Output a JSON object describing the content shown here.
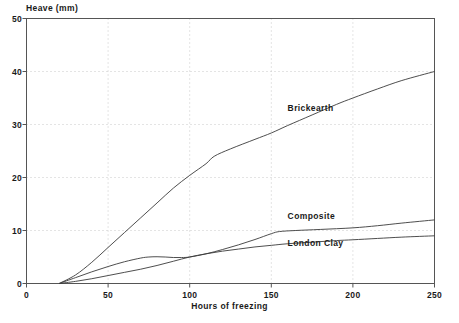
{
  "chart_data": {
    "type": "line",
    "title": "",
    "xlabel": "Hours of freezing",
    "ylabel": "Heave (mm)",
    "xlim": [
      0,
      250
    ],
    "ylim": [
      0,
      50
    ],
    "xticks": [
      0,
      50,
      100,
      150,
      200,
      250
    ],
    "yticks": [
      0,
      10,
      20,
      30,
      40,
      50
    ],
    "grid": true,
    "legend_position": "inline-annotations",
    "line_color": "#3a3a3a",
    "grid_color": "#c9c9c9",
    "axis_color": "#555555",
    "series": [
      {
        "name": "Brickearth",
        "label_x": 160,
        "label_y": 33,
        "x": [
          20,
          30,
          40,
          50,
          60,
          70,
          80,
          90,
          100,
          110,
          115,
          125,
          140,
          150,
          160,
          175,
          190,
          200,
          215,
          230,
          250
        ],
        "values": [
          0,
          1.6,
          4.0,
          6.8,
          9.6,
          12.4,
          15.2,
          18.0,
          20.4,
          22.6,
          24.0,
          25.4,
          27.2,
          28.4,
          29.8,
          31.8,
          33.8,
          35.0,
          36.7,
          38.3,
          40.0
        ]
      },
      {
        "name": "Composite",
        "label_x": 160,
        "label_y": 12.6,
        "x": [
          20,
          30,
          40,
          50,
          60,
          70,
          75,
          80,
          85,
          90,
          95,
          100,
          110,
          120,
          130,
          140,
          150,
          155,
          165,
          180,
          200,
          215,
          230,
          250
        ],
        "values": [
          0,
          1.1,
          2.2,
          3.2,
          4.1,
          4.8,
          5.0,
          5.05,
          5.0,
          4.9,
          4.9,
          5.0,
          5.6,
          6.4,
          7.3,
          8.3,
          9.4,
          9.8,
          10.0,
          10.2,
          10.5,
          10.9,
          11.4,
          12.0
        ]
      },
      {
        "name": "London Clay",
        "label_x": 160,
        "label_y": 7.5,
        "x": [
          20,
          30,
          40,
          50,
          60,
          70,
          80,
          90,
          100,
          110,
          120,
          130,
          140,
          150,
          160,
          175,
          190,
          200,
          215,
          230,
          250
        ],
        "values": [
          0,
          0.4,
          0.9,
          1.5,
          2.1,
          2.7,
          3.4,
          4.2,
          5.0,
          5.6,
          6.1,
          6.5,
          6.9,
          7.2,
          7.5,
          7.8,
          8.1,
          8.25,
          8.5,
          8.75,
          9.0
        ]
      }
    ]
  }
}
